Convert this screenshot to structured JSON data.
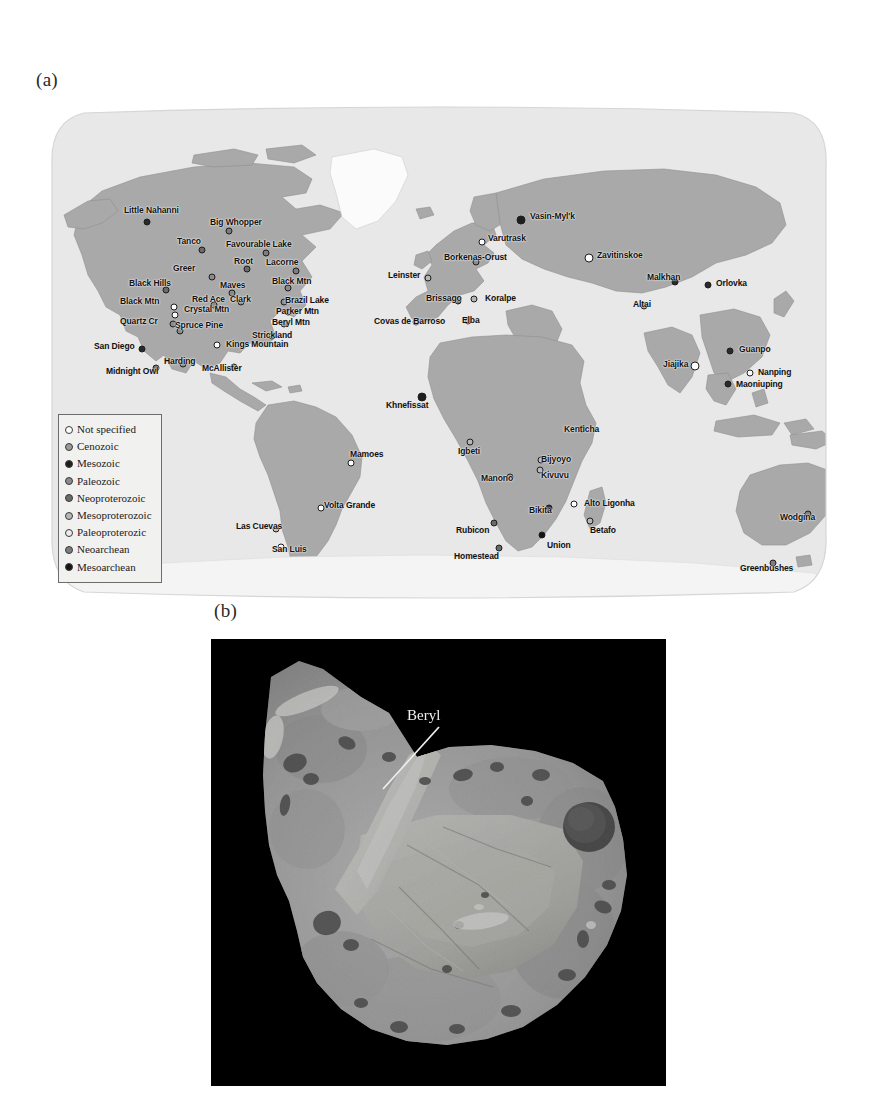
{
  "figure": {
    "panel_a_label": "(a)",
    "panel_b_label": "(b)"
  },
  "map": {
    "projection": "world",
    "ocean_color": "#e8e8e8",
    "land_color": "#a8a8a8",
    "ice_color": "#fbfbfb",
    "legend": {
      "title": "",
      "items": [
        {
          "label": "Not specified",
          "color": "#fdfdfd"
        },
        {
          "label": "Cenozoic",
          "color": "#9a9a9a"
        },
        {
          "label": "Mesozoic",
          "color": "#1e1e1e"
        },
        {
          "label": "Paleozoic",
          "color": "#8b8b8b"
        },
        {
          "label": "Neoproterozoic",
          "color": "#6a6a6a"
        },
        {
          "label": "Mesoproterozoic",
          "color": "#b6b6b6"
        },
        {
          "label": "Paleoproterozic",
          "color": "#ececec"
        },
        {
          "label": "Neoarchean",
          "color": "#7d7d7d"
        },
        {
          "label": "Mesoarchean",
          "color": "#141414"
        }
      ]
    },
    "sites": [
      {
        "name": "Little Nahanni",
        "x": 103,
        "y": 117,
        "lx": 80,
        "ly": 101,
        "color": "#2a2a2a",
        "size": "sm"
      },
      {
        "name": "Big Whopper",
        "x": 185,
        "y": 126,
        "lx": 166,
        "ly": 113,
        "color": "#7d7d7d",
        "size": "sm"
      },
      {
        "name": "Tanco",
        "x": 158,
        "y": 145,
        "lx": 133,
        "ly": 132,
        "color": "#6a6a6a",
        "size": "sm"
      },
      {
        "name": "Favourable Lake",
        "x": 222,
        "y": 148,
        "lx": 182,
        "ly": 135,
        "color": "#7d7d7d",
        "size": "sm"
      },
      {
        "name": "Root",
        "x": 203,
        "y": 164,
        "lx": 190,
        "ly": 152,
        "color": "#6a6a6a",
        "size": "sm"
      },
      {
        "name": "Lacorne",
        "x": 252,
        "y": 166,
        "lx": 222,
        "ly": 153,
        "color": "#7d7d7d",
        "size": "sm"
      },
      {
        "name": "Greer",
        "x": 168,
        "y": 172,
        "lx": 129,
        "ly": 159,
        "color": "#8b8b8b",
        "size": "sm"
      },
      {
        "name": "Maves",
        "x": 188,
        "y": 188,
        "lx": 176,
        "ly": 176,
        "color": "#8b8b8b",
        "size": "sm"
      },
      {
        "name": "Black Hills",
        "x": 122,
        "y": 185,
        "lx": 85,
        "ly": 174,
        "color": "#6a6a6a",
        "size": "sm"
      },
      {
        "name": "Black Mtn",
        "x": 244,
        "y": 183,
        "lx": 228,
        "ly": 172,
        "color": "#8b8b8b",
        "size": "sm"
      },
      {
        "name": "Brazil Lake",
        "x": 240,
        "y": 197,
        "lx": 241,
        "ly": 191,
        "color": "#8b8b8b",
        "size": "sm"
      },
      {
        "name": "Black Mtn",
        "x": 130,
        "y": 202,
        "lx": 76,
        "ly": 192,
        "color": "#fdfdfd",
        "size": "sm"
      },
      {
        "name": "Red Ace",
        "x": 170,
        "y": 200,
        "lx": 148,
        "ly": 190,
        "color": "#8b8b8b",
        "size": "sm"
      },
      {
        "name": "Clark",
        "x": 197,
        "y": 197,
        "lx": 186,
        "ly": 190,
        "color": "#8b8b8b",
        "size": "sm"
      },
      {
        "name": "Crystal Mtn",
        "x": 131,
        "y": 210,
        "lx": 140,
        "ly": 200,
        "color": "#fdfdfd",
        "size": "sm"
      },
      {
        "name": "Parker Mtn",
        "x": 244,
        "y": 207,
        "lx": 232,
        "ly": 202,
        "color": "#8b8b8b",
        "size": "sm"
      },
      {
        "name": "Quartz Cr",
        "x": 129,
        "y": 219,
        "lx": 76,
        "ly": 212,
        "color": "#8b8b8b",
        "size": "sm"
      },
      {
        "name": "Spruce Pine",
        "x": 136,
        "y": 226,
        "lx": 131,
        "ly": 216,
        "color": "#8b8b8b",
        "size": "sm"
      },
      {
        "name": "Beryl Mtn",
        "x": 240,
        "y": 219,
        "lx": 228,
        "ly": 213,
        "color": "#8b8b8b",
        "size": "sm"
      },
      {
        "name": "Strickland",
        "x": 228,
        "y": 231,
        "lx": 208,
        "ly": 226,
        "color": "#8b8b8b",
        "size": "sm"
      },
      {
        "name": "San Diego",
        "x": 98,
        "y": 244,
        "lx": 50,
        "ly": 237,
        "color": "#2a2a2a",
        "size": "sm"
      },
      {
        "name": "Kings Mountain",
        "x": 173,
        "y": 240,
        "lx": 182,
        "ly": 235,
        "color": "#fdfdfd",
        "size": "sm"
      },
      {
        "name": "Harding",
        "x": 139,
        "y": 259,
        "lx": 120,
        "ly": 252,
        "color": "#8b8b8b",
        "size": "sm"
      },
      {
        "name": "Midnight Owl",
        "x": 112,
        "y": 263,
        "lx": 62,
        "ly": 262,
        "color": "#6a6a6a",
        "size": "sm"
      },
      {
        "name": "McAllister",
        "x": 190,
        "y": 262,
        "lx": 158,
        "ly": 259,
        "color": "#8b8b8b",
        "size": "sm"
      },
      {
        "name": "Mamoes",
        "x": 307,
        "y": 358,
        "lx": 306,
        "ly": 345,
        "color": "#fdfdfd",
        "size": "sm"
      },
      {
        "name": "Volta Grande",
        "x": 277,
        "y": 403,
        "lx": 280,
        "ly": 396,
        "color": "#fdfdfd",
        "size": "sm"
      },
      {
        "name": "Las Cuevas",
        "x": 232,
        "y": 424,
        "lx": 192,
        "ly": 417,
        "color": "#b6b6b6",
        "size": "sm"
      },
      {
        "name": "San Luis",
        "x": 237,
        "y": 442,
        "lx": 228,
        "ly": 440,
        "color": "#fdfdfd",
        "size": "sm"
      },
      {
        "name": "Vasin-Myl'k",
        "x": 477,
        "y": 115,
        "lx": 486,
        "ly": 107,
        "color": "#1e1e1e",
        "size": "lg"
      },
      {
        "name": "Varutrask",
        "x": 438,
        "y": 137,
        "lx": 444,
        "ly": 129,
        "color": "#fdfdfd",
        "size": "sm"
      },
      {
        "name": "Borkenas-Orust",
        "x": 432,
        "y": 157,
        "lx": 400,
        "ly": 148,
        "color": "#8b8b8b",
        "size": "sm"
      },
      {
        "name": "Zavitinskoe",
        "x": 545,
        "y": 153,
        "lx": 553,
        "ly": 146,
        "color": "#fdfdfd",
        "size": "lg"
      },
      {
        "name": "Leinster",
        "x": 384,
        "y": 173,
        "lx": 344,
        "ly": 166,
        "color": "#b6b6b6",
        "size": "sm"
      },
      {
        "name": "Malkhan",
        "x": 631,
        "y": 177,
        "lx": 603,
        "ly": 168,
        "color": "#2a2a2a",
        "size": "sm"
      },
      {
        "name": "Orlovka",
        "x": 664,
        "y": 180,
        "lx": 672,
        "ly": 174,
        "color": "#2a2a2a",
        "size": "sm"
      },
      {
        "name": "Brissago",
        "x": 414,
        "y": 196,
        "lx": 382,
        "ly": 189,
        "color": "#6a6a6a",
        "size": "sm"
      },
      {
        "name": "Koralpe",
        "x": 430,
        "y": 194,
        "lx": 441,
        "ly": 189,
        "color": "#b6b6b6",
        "size": "sm"
      },
      {
        "name": "Altai",
        "x": 600,
        "y": 201,
        "lx": 589,
        "ly": 195,
        "color": "#8b8b8b",
        "size": "sm"
      },
      {
        "name": "Covas de Barroso",
        "x": 372,
        "y": 217,
        "lx": 330,
        "ly": 212,
        "color": "#b6b6b6",
        "size": "sm"
      },
      {
        "name": "Elba",
        "x": 424,
        "y": 216,
        "lx": 418,
        "ly": 211,
        "color": "#8b8b8b",
        "size": "sm"
      },
      {
        "name": "Guanpo",
        "x": 686,
        "y": 246,
        "lx": 695,
        "ly": 240,
        "color": "#2a2a2a",
        "size": "sm"
      },
      {
        "name": "Jiajika",
        "x": 651,
        "y": 261,
        "lx": 619,
        "ly": 255,
        "color": "#fdfdfd",
        "size": "lg"
      },
      {
        "name": "Nanping",
        "x": 706,
        "y": 268,
        "lx": 714,
        "ly": 263,
        "color": "#fdfdfd",
        "size": "sm"
      },
      {
        "name": "Maoniuping",
        "x": 684,
        "y": 279,
        "lx": 692,
        "ly": 275,
        "color": "#2a2a2a",
        "size": "sm"
      },
      {
        "name": "Khnefissat",
        "x": 378,
        "y": 292,
        "lx": 342,
        "ly": 296,
        "color": "#1e1e1e",
        "size": "lg"
      },
      {
        "name": "Igbeti",
        "x": 426,
        "y": 337,
        "lx": 414,
        "ly": 342,
        "color": "#b6b6b6",
        "size": "sm"
      },
      {
        "name": "Kenticha",
        "x": 538,
        "y": 324,
        "lx": 520,
        "ly": 320,
        "color": "#8b8b8b",
        "size": "sm"
      },
      {
        "name": "Bijyoyo",
        "x": 497,
        "y": 355,
        "lx": 497,
        "ly": 350,
        "color": "#b6b6b6",
        "size": "sm"
      },
      {
        "name": "Kivuvu",
        "x": 496,
        "y": 365,
        "lx": 497,
        "ly": 366,
        "color": "#b6b6b6",
        "size": "sm"
      },
      {
        "name": "Manono",
        "x": 466,
        "y": 372,
        "lx": 437,
        "ly": 369,
        "color": "#8b8b8b",
        "size": "sm"
      },
      {
        "name": "Alto Ligonha",
        "x": 530,
        "y": 399,
        "lx": 540,
        "ly": 394,
        "color": "#fdfdfd",
        "size": "sm"
      },
      {
        "name": "Bikita",
        "x": 505,
        "y": 403,
        "lx": 485,
        "ly": 401,
        "color": "#2a2a2a",
        "size": "sm"
      },
      {
        "name": "Betafo",
        "x": 546,
        "y": 416,
        "lx": 546,
        "ly": 421,
        "color": "#b6b6b6",
        "size": "sm"
      },
      {
        "name": "Rubicon",
        "x": 450,
        "y": 418,
        "lx": 412,
        "ly": 421,
        "color": "#6a6a6a",
        "size": "sm"
      },
      {
        "name": "Union",
        "x": 498,
        "y": 430,
        "lx": 503,
        "ly": 436,
        "color": "#141414",
        "size": "sm"
      },
      {
        "name": "Homestead",
        "x": 455,
        "y": 443,
        "lx": 410,
        "ly": 447,
        "color": "#6a6a6a",
        "size": "sm"
      },
      {
        "name": "Wodgina",
        "x": 764,
        "y": 409,
        "lx": 736,
        "ly": 408,
        "color": "#7d7d7d",
        "size": "sm"
      },
      {
        "name": "Greenbushes",
        "x": 729,
        "y": 458,
        "lx": 696,
        "ly": 459,
        "color": "#7d7d7d",
        "size": "sm"
      }
    ]
  },
  "photo": {
    "caption_annotations": [
      {
        "label": "Beryl"
      }
    ],
    "background_color": "#000000"
  }
}
